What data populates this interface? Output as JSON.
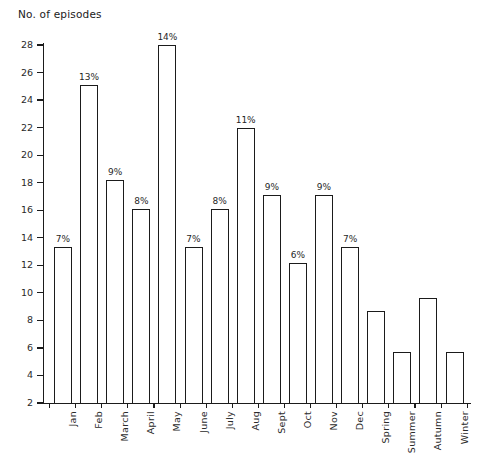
{
  "chart_data": {
    "type": "bar",
    "title": "",
    "ylabel": "No. of episodes",
    "xlabel": "",
    "ylim": [
      2,
      28
    ],
    "ytick_step": 2,
    "yticks": [
      2,
      4,
      6,
      8,
      10,
      12,
      14,
      16,
      18,
      20,
      22,
      24,
      26,
      28
    ],
    "grid": false,
    "legend": null,
    "bar_style": "hollow-outline",
    "categories": [
      "Jan",
      "Feb",
      "March",
      "April",
      "May",
      "June",
      "July",
      "Aug",
      "Sept",
      "Oct",
      "Nov",
      "Dec",
      "Spring",
      "Summer",
      "Autumn",
      "Winter"
    ],
    "values": [
      13.3,
      25.1,
      18.2,
      16.1,
      28.0,
      13.3,
      16.1,
      22.0,
      17.1,
      12.2,
      17.1,
      13.3,
      8.7,
      5.7,
      9.6,
      5.7
    ],
    "data_labels": [
      "7%",
      "13%",
      "9%",
      "8%",
      "14%",
      "7%",
      "8%",
      "11%",
      "9%",
      "6%",
      "9%",
      "7%",
      "",
      "",
      "",
      ""
    ]
  },
  "colors": {
    "axis": "#1b1b1b",
    "bar_outline": "#1b1b1b",
    "bar_fill": "#ffffff",
    "text": "#1f1f1f",
    "background": "#ffffff"
  }
}
